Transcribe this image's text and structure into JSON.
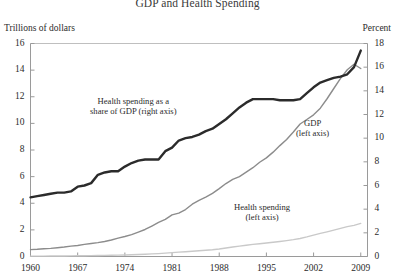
{
  "chart_data": {
    "type": "line",
    "title": "GDP and Health Spending",
    "xlabel": "",
    "ylabel": "Trillions of dollars",
    "y2label": "Percent",
    "xlim": [
      1960,
      2010
    ],
    "ylim": [
      0,
      16
    ],
    "y2lim": [
      0,
      18
    ],
    "grid": false,
    "legend_position": "inline-annotations",
    "x_ticks": [
      "1960",
      "1967",
      "1974",
      "1981",
      "1988",
      "1995",
      "2002",
      "2009"
    ],
    "y_ticks": [
      "0",
      "2",
      "4",
      "6",
      "8",
      "10",
      "12",
      "14",
      "16"
    ],
    "y2_ticks": [
      "0",
      "2",
      "4",
      "6",
      "8",
      "10",
      "12",
      "14",
      "16",
      "18"
    ],
    "x": [
      1960,
      1961,
      1962,
      1963,
      1964,
      1965,
      1966,
      1967,
      1968,
      1969,
      1970,
      1971,
      1972,
      1973,
      1974,
      1975,
      1976,
      1977,
      1978,
      1979,
      1980,
      1981,
      1982,
      1983,
      1984,
      1985,
      1986,
      1987,
      1988,
      1989,
      1990,
      1991,
      1992,
      1993,
      1994,
      1995,
      1996,
      1997,
      1998,
      1999,
      2000,
      2001,
      2002,
      2003,
      2004,
      2005,
      2006,
      2007,
      2008,
      2009
    ],
    "series": [
      {
        "name": "Health spending as a share of GDP (right axis)",
        "axis": "right",
        "unit": "percent",
        "color": "#2b2b2b",
        "width": 2.4,
        "values": [
          5.0,
          5.1,
          5.2,
          5.3,
          5.4,
          5.4,
          5.5,
          5.9,
          6.0,
          6.2,
          6.9,
          7.1,
          7.2,
          7.2,
          7.6,
          7.9,
          8.1,
          8.2,
          8.2,
          8.2,
          8.9,
          9.2,
          9.8,
          10.0,
          10.1,
          10.3,
          10.6,
          10.8,
          11.2,
          11.6,
          12.1,
          12.6,
          13.0,
          13.3,
          13.3,
          13.3,
          13.3,
          13.2,
          13.2,
          13.2,
          13.3,
          13.8,
          14.3,
          14.7,
          14.9,
          15.1,
          15.2,
          15.4,
          16.0,
          17.4
        ]
      },
      {
        "name": "GDP (left axis)",
        "axis": "left",
        "unit": "trillions of dollars",
        "color": "#8c8c8c",
        "width": 1.4,
        "values": [
          0.52,
          0.54,
          0.58,
          0.61,
          0.66,
          0.71,
          0.78,
          0.83,
          0.91,
          0.98,
          1.04,
          1.13,
          1.24,
          1.38,
          1.5,
          1.64,
          1.83,
          2.03,
          2.29,
          2.56,
          2.79,
          3.13,
          3.26,
          3.53,
          3.93,
          4.22,
          4.46,
          4.74,
          5.1,
          5.48,
          5.8,
          6.0,
          6.34,
          6.67,
          7.08,
          7.41,
          7.84,
          8.33,
          8.79,
          9.35,
          9.95,
          10.29,
          10.64,
          11.14,
          11.85,
          12.62,
          13.38,
          14.03,
          14.44,
          14.12
        ]
      },
      {
        "name": "Health spending (left axis)",
        "axis": "left",
        "unit": "trillions of dollars",
        "color": "#c9c9c9",
        "width": 1.4,
        "values": [
          0.027,
          0.029,
          0.031,
          0.034,
          0.038,
          0.042,
          0.046,
          0.051,
          0.058,
          0.065,
          0.073,
          0.081,
          0.091,
          0.102,
          0.116,
          0.132,
          0.152,
          0.172,
          0.194,
          0.219,
          0.253,
          0.294,
          0.325,
          0.357,
          0.394,
          0.429,
          0.467,
          0.509,
          0.567,
          0.638,
          0.714,
          0.782,
          0.849,
          0.913,
          0.962,
          1.016,
          1.068,
          1.125,
          1.19,
          1.265,
          1.353,
          1.47,
          1.602,
          1.733,
          1.855,
          1.981,
          2.113,
          2.24,
          2.34,
          2.486
        ]
      }
    ],
    "annotations": [
      {
        "name": "health-share-annotation",
        "lines": [
          "Health spending as a",
          "share of GDP (right axis)"
        ]
      },
      {
        "name": "gdp-annotation",
        "lines": [
          "GDP",
          "(left axis)"
        ]
      },
      {
        "name": "health-spending-annotation",
        "lines": [
          "Health spending",
          "(left axis)"
        ]
      }
    ]
  }
}
